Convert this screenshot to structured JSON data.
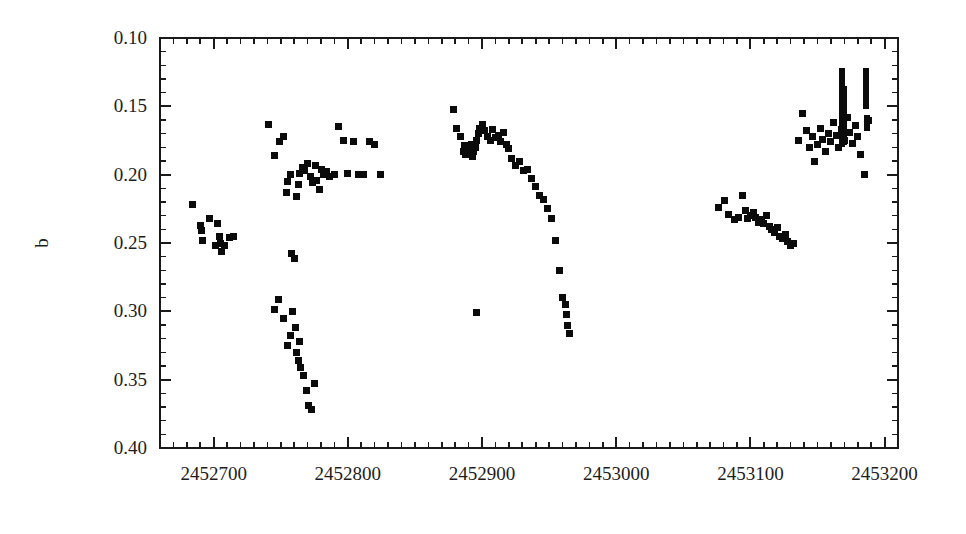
{
  "figure": {
    "background_color": "#ffffff",
    "ink_color": "#0b0b0b",
    "width": 966,
    "height": 534
  },
  "axes": {
    "y_title": "b",
    "x_title": "",
    "x_tick_labels": [
      "2452700",
      "2452800",
      "2452900",
      "2453000",
      "2453100",
      "2453200"
    ],
    "y_tick_labels": [
      "0.10",
      "0.15",
      "0.20",
      "0.25",
      "0.30",
      "0.35",
      "0.40"
    ]
  },
  "chart_data": {
    "type": "scatter",
    "title": "",
    "xlabel": "",
    "ylabel": "b",
    "xlim": [
      2452660,
      2453210
    ],
    "ylim": [
      0.4,
      0.1
    ],
    "y_inverted": true,
    "grid": false,
    "legend": null,
    "x_ticks_major": [
      2452700,
      2452800,
      2452900,
      2453000,
      2453100,
      2453200
    ],
    "x_tick_minor_step": 10,
    "y_ticks_major": [
      0.1,
      0.15,
      0.2,
      0.25,
      0.3,
      0.35,
      0.4
    ],
    "y_tick_minor_step": 0.01,
    "marker": "square",
    "marker_size_px": 7,
    "series": [
      {
        "name": "b magnitude",
        "x": [
          2452684,
          2452690,
          2452691,
          2452692,
          2452697,
          2452701,
          2452703,
          2452704,
          2452705,
          2452706,
          2452708,
          2452712,
          2452715,
          2452741,
          2452745,
          2452749,
          2452752,
          2452754,
          2452755,
          2452757,
          2452758,
          2452760,
          2452762,
          2452763,
          2452764,
          2452766,
          2452768,
          2452770,
          2452772,
          2452774,
          2452776,
          2452777,
          2452779,
          2452780,
          2452782,
          2452784,
          2452786,
          2452790,
          2452793,
          2452797,
          2452800,
          2452804,
          2452808,
          2452812,
          2452816,
          2452820,
          2452824,
          2452745,
          2452748,
          2452752,
          2452755,
          2452757,
          2452759,
          2452761,
          2452762,
          2452763,
          2452764,
          2452765,
          2452767,
          2452769,
          2452771,
          2452773,
          2452775,
          2452879,
          2452881,
          2452884,
          2452886,
          2452887,
          2452888,
          2452889,
          2452890,
          2452891,
          2452892,
          2452893,
          2452894,
          2452895,
          2452896,
          2452897,
          2452898,
          2452900,
          2452902,
          2452904,
          2452906,
          2452908,
          2452910,
          2452912,
          2452914,
          2452916,
          2452918,
          2452920,
          2452922,
          2452925,
          2452928,
          2452931,
          2452934,
          2452937,
          2452940,
          2452943,
          2452946,
          2452949,
          2452952,
          2452955,
          2452958,
          2452960,
          2452962,
          2452963,
          2452964,
          2452965,
          2452896,
          2453076,
          2453081,
          2453084,
          2453088,
          2453091,
          2453094,
          2453096,
          2453098,
          2453100,
          2453102,
          2453104,
          2453106,
          2453108,
          2453110,
          2453112,
          2453114,
          2453116,
          2453118,
          2453120,
          2453122,
          2453124,
          2453126,
          2453128,
          2453130,
          2453132,
          2453136,
          2453139,
          2453142,
          2453144,
          2453146,
          2453148,
          2453150,
          2453152,
          2453154,
          2453156,
          2453158,
          2453160,
          2453162,
          2453164,
          2453166,
          2453168,
          2453170,
          2453172,
          2453174,
          2453176,
          2453178,
          2453180,
          2453182,
          2453185,
          2453188
        ],
        "y": [
          0.222,
          0.237,
          0.241,
          0.248,
          0.232,
          0.252,
          0.236,
          0.245,
          0.25,
          0.256,
          0.252,
          0.246,
          0.245,
          0.163,
          0.186,
          0.176,
          0.172,
          0.213,
          0.205,
          0.2,
          0.258,
          0.261,
          0.216,
          0.207,
          0.199,
          0.195,
          0.197,
          0.192,
          0.201,
          0.206,
          0.193,
          0.204,
          0.211,
          0.196,
          0.2,
          0.198,
          0.201,
          0.2,
          0.165,
          0.175,
          0.199,
          0.176,
          0.2,
          0.2,
          0.176,
          0.178,
          0.2,
          0.299,
          0.291,
          0.305,
          0.325,
          0.318,
          0.3,
          0.312,
          0.33,
          0.336,
          0.322,
          0.341,
          0.347,
          0.358,
          0.369,
          0.372,
          0.353,
          0.152,
          0.166,
          0.172,
          0.183,
          0.179,
          0.185,
          0.182,
          0.184,
          0.181,
          0.178,
          0.187,
          0.183,
          0.18,
          0.175,
          0.17,
          0.166,
          0.163,
          0.168,
          0.172,
          0.175,
          0.167,
          0.173,
          0.171,
          0.176,
          0.169,
          0.178,
          0.181,
          0.188,
          0.193,
          0.19,
          0.197,
          0.196,
          0.203,
          0.209,
          0.215,
          0.218,
          0.225,
          0.232,
          0.248,
          0.27,
          0.29,
          0.295,
          0.302,
          0.31,
          0.316,
          0.301,
          0.224,
          0.219,
          0.229,
          0.233,
          0.231,
          0.215,
          0.226,
          0.232,
          0.23,
          0.228,
          0.231,
          0.235,
          0.233,
          0.236,
          0.23,
          0.238,
          0.24,
          0.242,
          0.239,
          0.245,
          0.247,
          0.244,
          0.249,
          0.252,
          0.25,
          0.175,
          0.155,
          0.168,
          0.18,
          0.172,
          0.19,
          0.178,
          0.166,
          0.174,
          0.183,
          0.17,
          0.176,
          0.162,
          0.171,
          0.18,
          0.167,
          0.175,
          0.158,
          0.169,
          0.177,
          0.164,
          0.172,
          0.185,
          0.2,
          0.16
        ]
      }
    ],
    "dense_bars": [
      {
        "x": 2453168,
        "y_top": 0.122,
        "y_bottom": 0.18,
        "width_px": 6
      },
      {
        "x": 2453170,
        "y_top": 0.135,
        "y_bottom": 0.178,
        "width_px": 6
      },
      {
        "x": 2453186,
        "y_top": 0.122,
        "y_bottom": 0.152,
        "width_px": 6
      },
      {
        "x": 2453187,
        "y_top": 0.156,
        "y_bottom": 0.168,
        "width_px": 6
      }
    ]
  }
}
